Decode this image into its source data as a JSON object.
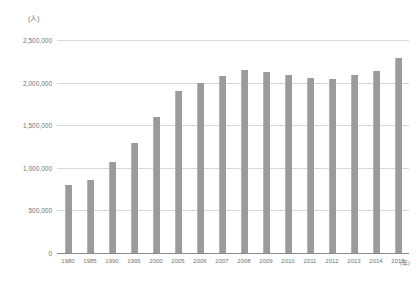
{
  "chart_data": {
    "type": "bar",
    "title": "",
    "subtitle": "",
    "xlabel": "(年)",
    "ylabel": "(人)",
    "categories": [
      "1980",
      "1985",
      "1990",
      "1995",
      "2000",
      "2005",
      "2006",
      "2007",
      "2008",
      "2009",
      "2010",
      "2011",
      "2012",
      "2013",
      "2014",
      "2015"
    ],
    "values": [
      795000,
      855000,
      1065000,
      1290000,
      1600000,
      1905000,
      1995000,
      2075000,
      2145000,
      2120000,
      2095000,
      2055000,
      2040000,
      2085000,
      2140000,
      2290000
    ],
    "ylim": [
      0,
      2500000
    ],
    "ytick_labels": [
      "2,500,000",
      "2,000,000",
      "1,500,000",
      "1,000,000",
      "500,000",
      "0"
    ],
    "ytick_values": [
      2500000,
      2000000,
      1500000,
      1000000,
      500000,
      0
    ],
    "grid": true,
    "legend": "none",
    "series": [
      {
        "name": "",
        "values": [
          795000,
          855000,
          1065000,
          1290000,
          1600000,
          1905000,
          1995000,
          2075000,
          2145000,
          2120000,
          2095000,
          2055000,
          2040000,
          2085000,
          2140000,
          2290000
        ]
      }
    ],
    "bar_color": "#9b9b9b",
    "grid_color": "#d7d7d7",
    "axis_color": "#8a8a8a",
    "text_color": "#747474"
  }
}
